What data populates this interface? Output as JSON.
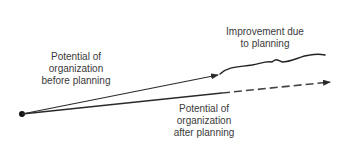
{
  "diagram": {
    "labels": {
      "before": [
        "Potential of",
        "organization",
        "before planning"
      ],
      "improvement": [
        "Improvement due",
        "to planning"
      ],
      "after": [
        "Potential of",
        "organization",
        "after planning"
      ]
    },
    "colors": {
      "line": "#2a2a2a",
      "text": "#3a3a3a",
      "dashed": "#444444"
    }
  }
}
